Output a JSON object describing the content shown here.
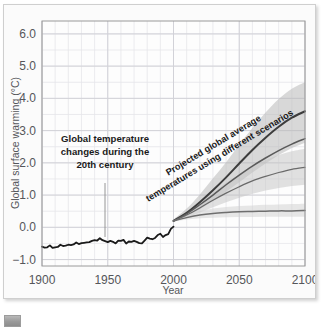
{
  "figure": {
    "title_visible": false,
    "thumbnail_icon": "image-thumbnail-icon"
  },
  "axes": {
    "x_title": "Year",
    "y_title": "Global surface warming (°C)",
    "x_ticks": [
      "1900",
      "1950",
      "2000",
      "2050",
      "2100"
    ],
    "y_ticks": [
      "6.0",
      "5.0",
      "4.0",
      "3.0",
      "2.0",
      "1.0",
      "0.0",
      "-1.0"
    ]
  },
  "annotations": {
    "historical": "Global temperature\nchanges during the\n20th century",
    "historical_line1": "Global temperature",
    "historical_line2": "changes during the",
    "historical_line3": "20th century",
    "projection_line1": "Projected global average",
    "projection_line2": "temperatures using different scenarios"
  },
  "colors": {
    "historical_line": "#1a1a1a",
    "scenario_line": "#4a4a4a",
    "band_fill": "#b9b9b9",
    "gridline_minor": "#e6e6ea",
    "gridline_major": "#d2d2d8",
    "plot_background": "#fdfdfd",
    "frame": "#9a9a9a",
    "tick_text": "#55565a"
  },
  "chart_data": {
    "type": "line",
    "title": "",
    "xlabel": "Year",
    "ylabel": "Global surface warming (°C)",
    "xlim": [
      1900,
      2100
    ],
    "ylim": [
      -1.2,
      6.4
    ],
    "xticks": [
      1900,
      1950,
      2000,
      2050,
      2100
    ],
    "yticks": [
      -1.0,
      0.0,
      1.0,
      2.0,
      3.0,
      4.0,
      5.0,
      6.0
    ],
    "grid": true,
    "grid_minor_x_step": 10,
    "grid_minor_y_step": 0.5,
    "legend": "none",
    "annotations": [
      {
        "text": "Global temperature changes during the 20th century",
        "x": 1945,
        "y": 2.45,
        "pointer_to": {
          "x": 1945,
          "y": -0.38
        }
      },
      {
        "text": "Projected global average temperatures using different scenarios",
        "x": 2050,
        "y": 2.1,
        "rotation": -30
      }
    ],
    "series": [
      {
        "name": "Observed global temperature (20th century)",
        "type": "line",
        "color": "#1a1a1a",
        "width": 1.8,
        "x": [
          1900,
          1902,
          1904,
          1906,
          1908,
          1910,
          1912,
          1914,
          1916,
          1918,
          1920,
          1922,
          1924,
          1926,
          1928,
          1930,
          1932,
          1934,
          1936,
          1938,
          1940,
          1942,
          1944,
          1946,
          1948,
          1950,
          1952,
          1954,
          1956,
          1958,
          1960,
          1962,
          1964,
          1966,
          1968,
          1970,
          1972,
          1974,
          1976,
          1978,
          1980,
          1982,
          1984,
          1986,
          1988,
          1990,
          1992,
          1994,
          1996,
          1998,
          2000
        ],
        "y": [
          -0.6,
          -0.63,
          -0.62,
          -0.56,
          -0.64,
          -0.62,
          -0.61,
          -0.54,
          -0.58,
          -0.57,
          -0.54,
          -0.55,
          -0.53,
          -0.47,
          -0.52,
          -0.49,
          -0.48,
          -0.47,
          -0.46,
          -0.42,
          -0.4,
          -0.41,
          -0.34,
          -0.4,
          -0.43,
          -0.46,
          -0.42,
          -0.45,
          -0.5,
          -0.41,
          -0.42,
          -0.39,
          -0.5,
          -0.44,
          -0.45,
          -0.42,
          -0.45,
          -0.49,
          -0.5,
          -0.41,
          -0.32,
          -0.35,
          -0.37,
          -0.33,
          -0.24,
          -0.2,
          -0.3,
          -0.24,
          -0.21,
          -0.05,
          0.02
        ]
      },
      {
        "name": "High scenario (A2-like)",
        "type": "line",
        "color": "#3d3d3d",
        "width": 2.0,
        "x": [
          2000,
          2010,
          2020,
          2030,
          2040,
          2050,
          2060,
          2070,
          2080,
          2090,
          2100
        ],
        "y": [
          0.2,
          0.45,
          0.78,
          1.15,
          1.55,
          1.98,
          2.4,
          2.78,
          3.12,
          3.4,
          3.6
        ]
      },
      {
        "name": "High scenario uncertainty band",
        "type": "band",
        "color": "#b9b9b9",
        "opacity": 0.55,
        "x": [
          2000,
          2010,
          2020,
          2030,
          2040,
          2050,
          2060,
          2070,
          2080,
          2090,
          2100
        ],
        "y_lower": [
          0.18,
          0.34,
          0.56,
          0.82,
          1.1,
          1.4,
          1.7,
          1.98,
          2.24,
          2.46,
          2.62
        ],
        "y_upper": [
          0.24,
          0.58,
          1.02,
          1.52,
          2.02,
          2.56,
          3.08,
          3.56,
          3.98,
          4.3,
          4.5
        ]
      },
      {
        "name": "Mid-high scenario (A1B-like)",
        "type": "line",
        "color": "#5a5a5a",
        "width": 1.5,
        "x": [
          2000,
          2010,
          2020,
          2030,
          2040,
          2050,
          2060,
          2070,
          2080,
          2090,
          2100
        ],
        "y": [
          0.2,
          0.42,
          0.7,
          1.0,
          1.32,
          1.62,
          1.9,
          2.15,
          2.38,
          2.58,
          2.75
        ]
      },
      {
        "name": "Mid scenario (B1-like)",
        "type": "line",
        "color": "#6a6a6a",
        "width": 1.2,
        "x": [
          2000,
          2010,
          2020,
          2030,
          2040,
          2050,
          2060,
          2070,
          2080,
          2090,
          2100
        ],
        "y": [
          0.2,
          0.38,
          0.6,
          0.84,
          1.06,
          1.26,
          1.44,
          1.58,
          1.7,
          1.8,
          1.86
        ]
      },
      {
        "name": "Mid scenario uncertainty band",
        "type": "band",
        "color": "#c4c4c4",
        "opacity": 0.5,
        "x": [
          2000,
          2010,
          2020,
          2030,
          2040,
          2050,
          2060,
          2070,
          2080,
          2090,
          2100
        ],
        "y_lower": [
          0.18,
          0.3,
          0.46,
          0.62,
          0.78,
          0.92,
          1.04,
          1.14,
          1.22,
          1.28,
          1.32
        ],
        "y_upper": [
          0.24,
          0.48,
          0.78,
          1.08,
          1.38,
          1.64,
          1.88,
          2.08,
          2.24,
          2.36,
          2.44
        ]
      },
      {
        "name": "Low scenario (constant composition commitment)",
        "type": "line",
        "color": "#6e6e6e",
        "width": 1.5,
        "x": [
          2000,
          2010,
          2020,
          2030,
          2040,
          2050,
          2060,
          2070,
          2080,
          2090,
          2100
        ],
        "y": [
          0.2,
          0.3,
          0.38,
          0.43,
          0.46,
          0.48,
          0.49,
          0.5,
          0.51,
          0.51,
          0.52
        ]
      },
      {
        "name": "Low scenario uncertainty band",
        "type": "band",
        "color": "#d0d0d0",
        "opacity": 0.5,
        "x": [
          2000,
          2010,
          2020,
          2030,
          2040,
          2050,
          2060,
          2070,
          2080,
          2090,
          2100
        ],
        "y_lower": [
          0.18,
          0.24,
          0.28,
          0.3,
          0.31,
          0.32,
          0.32,
          0.33,
          0.33,
          0.33,
          0.33
        ],
        "y_upper": [
          0.24,
          0.38,
          0.5,
          0.58,
          0.63,
          0.66,
          0.68,
          0.7,
          0.71,
          0.72,
          0.73
        ]
      }
    ]
  }
}
